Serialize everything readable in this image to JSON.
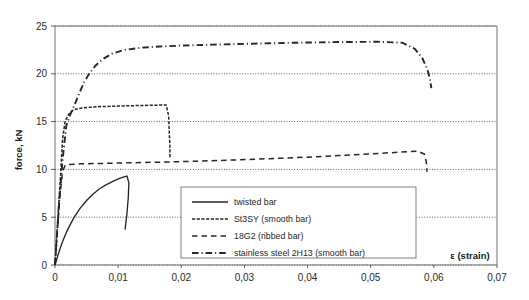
{
  "chart_data": {
    "type": "line",
    "title": "",
    "xlabel": "ε (strain)",
    "ylabel": "force, kN",
    "xlim": [
      0,
      0.07
    ],
    "ylim": [
      0,
      25
    ],
    "xticks": [
      0,
      0.01,
      0.02,
      0.03,
      0.04,
      0.05,
      0.06,
      0.07
    ],
    "xticklabels": [
      "0",
      "0,01",
      "0,02",
      "0,03",
      "0,04",
      "0,05",
      "0,06",
      "0,07"
    ],
    "yticks": [
      0,
      5,
      10,
      15,
      20,
      25
    ],
    "yticklabels": [
      "0",
      "5",
      "10",
      "15",
      "20",
      "25"
    ],
    "grid": "horizontal-dotted",
    "legend_position": "inside-lower-center",
    "series": [
      {
        "name": "twisted bar",
        "style": "solid",
        "points": [
          [
            0.0,
            0.0
          ],
          [
            0.0006,
            1.3
          ],
          [
            0.0012,
            2.45
          ],
          [
            0.002,
            3.7
          ],
          [
            0.003,
            4.95
          ],
          [
            0.004,
            5.95
          ],
          [
            0.005,
            6.75
          ],
          [
            0.006,
            7.4
          ],
          [
            0.007,
            7.95
          ],
          [
            0.008,
            8.35
          ],
          [
            0.009,
            8.7
          ],
          [
            0.01,
            9.0
          ],
          [
            0.0108,
            9.2
          ],
          [
            0.0114,
            9.3
          ],
          [
            0.0117,
            8.6
          ],
          [
            0.0116,
            7.0
          ],
          [
            0.0114,
            5.4
          ],
          [
            0.0112,
            4.3
          ],
          [
            0.0111,
            3.7
          ]
        ]
      },
      {
        "name": "St3SY (smooth bar)",
        "style": "dashed-short",
        "points": [
          [
            0.0,
            0.0
          ],
          [
            0.0004,
            4.4
          ],
          [
            0.0009,
            9.6
          ],
          [
            0.0012,
            13.2
          ],
          [
            0.0016,
            15.0
          ],
          [
            0.002,
            15.6
          ],
          [
            0.0024,
            15.95
          ],
          [
            0.003,
            16.25
          ],
          [
            0.004,
            16.4
          ],
          [
            0.0055,
            16.5
          ],
          [
            0.0075,
            16.58
          ],
          [
            0.01,
            16.62
          ],
          [
            0.013,
            16.68
          ],
          [
            0.016,
            16.72
          ],
          [
            0.0176,
            16.74
          ],
          [
            0.018,
            15.6
          ],
          [
            0.0181,
            13.8
          ],
          [
            0.0182,
            12.4
          ],
          [
            0.0182,
            11.2
          ]
        ]
      },
      {
        "name": "18G2 (ribbed bar)",
        "style": "dashed-long",
        "points": [
          [
            0.0,
            0.0
          ],
          [
            0.0004,
            3.8
          ],
          [
            0.0008,
            7.4
          ],
          [
            0.0012,
            9.8
          ],
          [
            0.0016,
            10.4
          ],
          [
            0.0022,
            10.52
          ],
          [
            0.004,
            10.58
          ],
          [
            0.007,
            10.62
          ],
          [
            0.011,
            10.68
          ],
          [
            0.016,
            10.75
          ],
          [
            0.022,
            10.85
          ],
          [
            0.028,
            10.98
          ],
          [
            0.034,
            11.12
          ],
          [
            0.04,
            11.28
          ],
          [
            0.045,
            11.45
          ],
          [
            0.05,
            11.62
          ],
          [
            0.0545,
            11.8
          ],
          [
            0.0575,
            11.9
          ],
          [
            0.0585,
            11.6
          ],
          [
            0.0588,
            10.8
          ],
          [
            0.0589,
            10.1
          ],
          [
            0.0589,
            9.75
          ]
        ]
      },
      {
        "name": "stainless steel 2H13 (smooth bar)",
        "style": "dash-dot",
        "points": [
          [
            0.0,
            0.0
          ],
          [
            0.0006,
            6.0
          ],
          [
            0.0012,
            11.0
          ],
          [
            0.0018,
            14.6
          ],
          [
            0.0024,
            15.7
          ],
          [
            0.003,
            16.6
          ],
          [
            0.0038,
            17.9
          ],
          [
            0.0046,
            19.1
          ],
          [
            0.0054,
            20.0
          ],
          [
            0.0064,
            20.85
          ],
          [
            0.0076,
            21.55
          ],
          [
            0.009,
            22.1
          ],
          [
            0.011,
            22.5
          ],
          [
            0.0135,
            22.72
          ],
          [
            0.0165,
            22.85
          ],
          [
            0.02,
            22.95
          ],
          [
            0.025,
            23.05
          ],
          [
            0.031,
            23.15
          ],
          [
            0.038,
            23.25
          ],
          [
            0.045,
            23.32
          ],
          [
            0.051,
            23.35
          ],
          [
            0.055,
            23.25
          ],
          [
            0.057,
            22.6
          ],
          [
            0.0582,
            21.6
          ],
          [
            0.059,
            20.4
          ],
          [
            0.0594,
            19.4
          ],
          [
            0.0596,
            18.5
          ]
        ]
      }
    ]
  },
  "legend": {
    "items": [
      {
        "label": "twisted bar",
        "style": "solid"
      },
      {
        "label": "St3SY (smooth bar)",
        "style": "dashed-short"
      },
      {
        "label": "18G2 (ribbed bar)",
        "style": "dashed-long"
      },
      {
        "label": "stainless steel 2H13 (smooth bar)",
        "style": "dash-dot"
      }
    ]
  },
  "axes": {
    "y_title": "force, kN",
    "x_title": "ε (strain)"
  },
  "colors": {
    "ink": "#262626",
    "frame": "#6e6e6e",
    "grid": "#4d4d4d",
    "background": "#ffffff"
  }
}
